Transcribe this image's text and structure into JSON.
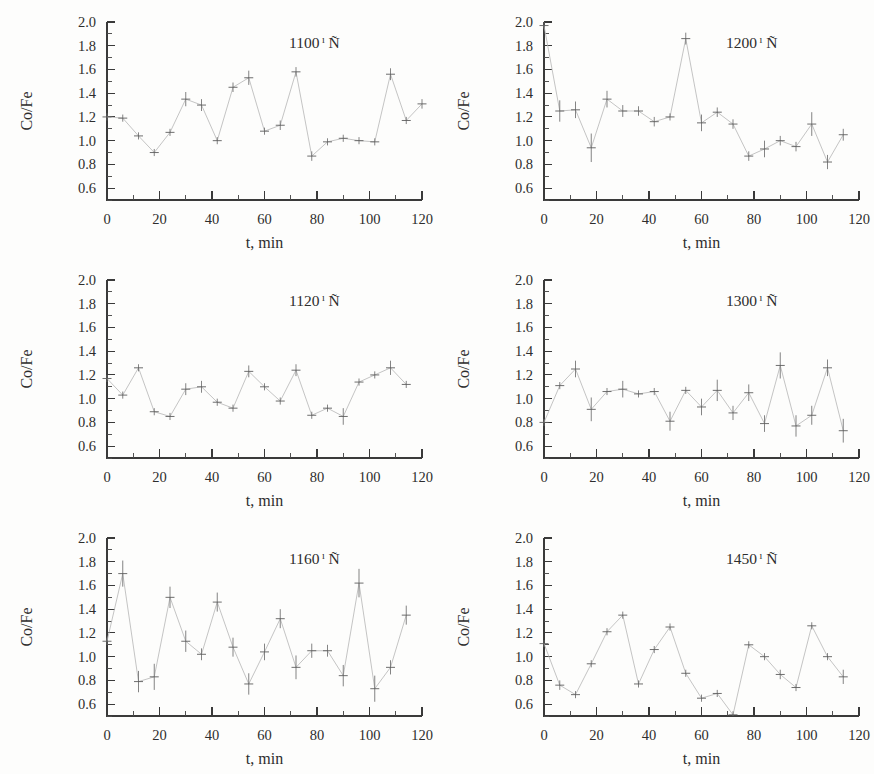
{
  "figure": {
    "background_color": "#fdfdfc",
    "ink_color": "#2d2d2d",
    "line_color": "#b9b9b9",
    "marker_color": "#555555",
    "panel_count": 6,
    "columns": 2,
    "rows": 3
  },
  "axes": {
    "xlabel": "t, min",
    "ylabel": "Co/Fe",
    "xlim": [
      0,
      120
    ],
    "ylim": [
      0.5,
      2.0
    ],
    "xticks": [
      0,
      20,
      40,
      60,
      80,
      100,
      120
    ],
    "xtick_labels": [
      "0",
      "20",
      "40",
      "60",
      "80",
      "100",
      "120"
    ],
    "xminor_step": 10,
    "yticks": [
      0.6,
      0.8,
      1.0,
      1.2,
      1.4,
      1.6,
      1.8,
      2.0
    ],
    "ytick_labels": [
      "0.6",
      "0.8",
      "1.0",
      "1.2",
      "1.4",
      "1.6",
      "1.8",
      "2.0"
    ],
    "yminor_step": 0.1,
    "grid": false,
    "legend": "none"
  },
  "chart_data": [
    {
      "type": "line",
      "panel_index": 0,
      "position": "top-left",
      "title": "1100 ı Ñ",
      "title_value": "1100",
      "title_unit": "°C",
      "title_unit_glyphs": {
        "sup": "ı",
        "base": "Ñ"
      },
      "xlabel": "t, min",
      "ylabel": "Co/Fe",
      "xlim": [
        0,
        120
      ],
      "ylim": [
        0.5,
        2.0
      ],
      "x": [
        0,
        6,
        12,
        18,
        24,
        30,
        36,
        42,
        48,
        54,
        60,
        66,
        72,
        78,
        84,
        90,
        96,
        102,
        108,
        114,
        120
      ],
      "y": [
        1.2,
        1.19,
        1.04,
        0.9,
        1.07,
        1.35,
        1.3,
        1.0,
        1.45,
        1.53,
        1.08,
        1.13,
        1.58,
        0.87,
        0.99,
        1.02,
        1.0,
        0.99,
        1.56,
        1.17,
        1.31
      ],
      "yerr": [
        0.03,
        0.03,
        0.03,
        0.03,
        0.03,
        0.06,
        0.05,
        0.03,
        0.04,
        0.06,
        0.03,
        0.04,
        0.04,
        0.04,
        0.03,
        0.03,
        0.03,
        0.03,
        0.05,
        0.03,
        0.04
      ]
    },
    {
      "type": "line",
      "panel_index": 1,
      "position": "top-right",
      "title": "1200 ı Ñ",
      "title_value": "1200",
      "title_unit": "°C",
      "title_unit_glyphs": {
        "sup": "ı",
        "base": "Ñ"
      },
      "xlabel": "t, min",
      "ylabel": "Co/Fe",
      "xlim": [
        0,
        120
      ],
      "ylim": [
        0.5,
        2.0
      ],
      "x": [
        0,
        6,
        12,
        18,
        24,
        30,
        36,
        42,
        48,
        54,
        60,
        66,
        72,
        78,
        84,
        90,
        96,
        102,
        108,
        114
      ],
      "y": [
        1.97,
        1.25,
        1.26,
        0.94,
        1.35,
        1.25,
        1.25,
        1.16,
        1.2,
        1.86,
        1.15,
        1.24,
        1.14,
        0.87,
        0.93,
        1.0,
        0.95,
        1.14,
        0.82,
        1.05
      ],
      "yerr": [
        0.03,
        0.09,
        0.07,
        0.12,
        0.07,
        0.05,
        0.04,
        0.04,
        0.03,
        0.05,
        0.07,
        0.04,
        0.04,
        0.04,
        0.07,
        0.04,
        0.04,
        0.1,
        0.06,
        0.05
      ]
    },
    {
      "type": "line",
      "panel_index": 2,
      "position": "middle-left",
      "title": "1120 ı Ñ",
      "title_value": "1120",
      "title_unit": "°C",
      "title_unit_glyphs": {
        "sup": "ı",
        "base": "Ñ"
      },
      "xlabel": "t, min",
      "ylabel": "Co/Fe",
      "xlim": [
        0,
        120
      ],
      "ylim": [
        0.5,
        2.0
      ],
      "x": [
        0,
        6,
        12,
        18,
        24,
        30,
        36,
        42,
        48,
        54,
        60,
        66,
        72,
        78,
        84,
        90,
        96,
        102,
        108,
        114
      ],
      "y": [
        1.17,
        1.03,
        1.26,
        0.89,
        0.85,
        1.08,
        1.1,
        0.97,
        0.92,
        1.23,
        1.1,
        0.98,
        1.24,
        0.86,
        0.92,
        0.85,
        1.14,
        1.2,
        1.26,
        1.12
      ],
      "yerr": [
        0.03,
        0.03,
        0.03,
        0.03,
        0.03,
        0.05,
        0.05,
        0.03,
        0.03,
        0.05,
        0.03,
        0.03,
        0.05,
        0.03,
        0.03,
        0.07,
        0.03,
        0.03,
        0.06,
        0.03
      ]
    },
    {
      "type": "line",
      "panel_index": 3,
      "position": "middle-right",
      "title": "1300 ı Ñ",
      "title_value": "1300",
      "title_unit": "°C",
      "title_unit_glyphs": {
        "sup": "ı",
        "base": "Ñ"
      },
      "xlabel": "t, min",
      "ylabel": "Co/Fe",
      "xlim": [
        0,
        120
      ],
      "ylim": [
        0.5,
        2.0
      ],
      "x": [
        0,
        6,
        12,
        18,
        24,
        30,
        36,
        42,
        48,
        54,
        60,
        66,
        72,
        78,
        84,
        90,
        96,
        102,
        108,
        114
      ],
      "y": [
        0.8,
        1.11,
        1.25,
        0.91,
        1.06,
        1.08,
        1.04,
        1.06,
        0.81,
        1.07,
        0.93,
        1.07,
        0.88,
        1.05,
        0.79,
        1.28,
        0.77,
        0.86,
        1.26,
        0.73
      ],
      "yerr": [
        0.03,
        0.03,
        0.07,
        0.1,
        0.03,
        0.07,
        0.03,
        0.03,
        0.08,
        0.03,
        0.07,
        0.09,
        0.06,
        0.07,
        0.07,
        0.11,
        0.09,
        0.08,
        0.07,
        0.1
      ]
    },
    {
      "type": "line",
      "panel_index": 4,
      "position": "bottom-left",
      "title": "1160 ı Ñ",
      "title_value": "1160",
      "title_unit": "°C",
      "title_unit_glyphs": {
        "sup": "ı",
        "base": "Ñ"
      },
      "xlabel": "t, min",
      "ylabel": "Co/Fe",
      "xlim": [
        0,
        120
      ],
      "ylim": [
        0.5,
        2.0
      ],
      "x": [
        0,
        6,
        12,
        18,
        24,
        30,
        36,
        42,
        48,
        54,
        60,
        66,
        72,
        78,
        84,
        90,
        96,
        102,
        108,
        114
      ],
      "y": [
        1.13,
        1.7,
        0.79,
        0.83,
        1.5,
        1.13,
        1.02,
        1.46,
        1.08,
        0.77,
        1.04,
        1.32,
        0.91,
        1.05,
        1.05,
        0.84,
        1.62,
        0.73,
        0.91,
        1.35
      ],
      "yerr": [
        0.03,
        0.11,
        0.09,
        0.11,
        0.09,
        0.09,
        0.05,
        0.08,
        0.08,
        0.09,
        0.07,
        0.08,
        0.1,
        0.06,
        0.05,
        0.09,
        0.12,
        0.11,
        0.06,
        0.08
      ]
    },
    {
      "type": "line",
      "panel_index": 5,
      "position": "bottom-right",
      "title": "1450 ı Ñ",
      "title_value": "1450",
      "title_unit": "°C",
      "title_unit_glyphs": {
        "sup": "ı",
        "base": "Ñ"
      },
      "xlabel": "t, min",
      "ylabel": "Co/Fe",
      "xlim": [
        0,
        120
      ],
      "ylim": [
        0.5,
        2.0
      ],
      "x": [
        0,
        6,
        12,
        18,
        24,
        30,
        36,
        42,
        48,
        54,
        60,
        66,
        72,
        78,
        84,
        90,
        96,
        102,
        108,
        114
      ],
      "y": [
        1.11,
        0.76,
        0.68,
        0.94,
        1.21,
        1.35,
        0.77,
        1.06,
        1.25,
        0.86,
        0.65,
        0.69,
        0.51,
        1.1,
        1.0,
        0.85,
        0.74,
        1.26,
        1.0,
        0.83
      ],
      "yerr": [
        0.03,
        0.04,
        0.03,
        0.03,
        0.03,
        0.03,
        0.03,
        0.03,
        0.03,
        0.03,
        0.03,
        0.03,
        0.03,
        0.03,
        0.03,
        0.04,
        0.03,
        0.03,
        0.03,
        0.06
      ]
    }
  ]
}
